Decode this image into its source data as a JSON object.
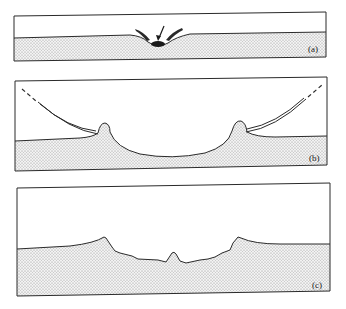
{
  "figure": {
    "panels": [
      {
        "id": "a",
        "label": "(a)",
        "stage": "impactor striking surface with ejecta beginning"
      },
      {
        "id": "b",
        "label": "(b)",
        "stage": "transient crater with ejecta curtain and raised rims"
      },
      {
        "id": "c",
        "label": "(c)",
        "stage": "final crater with central peak"
      }
    ]
  },
  "colors": {
    "line": "#2a2a2a",
    "stipple": "#8a8a8a",
    "background": "#ffffff"
  }
}
